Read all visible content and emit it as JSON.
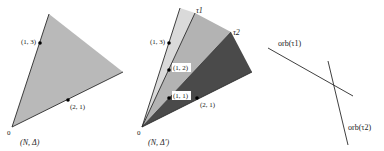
{
  "colors": {
    "background": "#ffffff",
    "stroke": "#2a2a2a",
    "fill_light": "#d9d9d9",
    "fill_mid": "#b4b4b4",
    "fill_dark": "#4a4a4a",
    "fill_triangle": "#b9b9b9",
    "label_box": "#ffffff"
  },
  "left_panel": {
    "caption": "(N, Δ)",
    "origin_label": "0",
    "points": [
      {
        "label": "(1, 3)",
        "x": 40,
        "y": 43
      },
      {
        "label": "(2, 1)",
        "x": 68,
        "y": 100
      }
    ]
  },
  "middle_panel": {
    "caption": "(N, Δ′)",
    "origin_label": "0",
    "ray_labels": {
      "tau1": "τ1",
      "tau2": "τ2"
    },
    "points": [
      {
        "label": "(1, 3)",
        "x": 169,
        "y": 43
      },
      {
        "label": "(1, 2)",
        "x": 169,
        "y": 70
      },
      {
        "label": "(1, 1)",
        "x": 169,
        "y": 98
      },
      {
        "label": "(2, 1)",
        "x": 197,
        "y": 98
      }
    ]
  },
  "right_panel": {
    "lines": [
      {
        "label": "orb(τ1)"
      },
      {
        "label": "orb(τ2)"
      }
    ]
  }
}
